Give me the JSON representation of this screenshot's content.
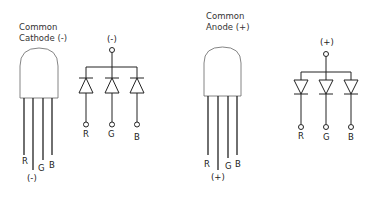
{
  "diagrams": [
    {
      "title_line1": "Common",
      "title_line2": "Cathode (-)",
      "common_label": "(-)",
      "lead_labels": {
        "r": "R",
        "common": "(-)",
        "g": "G",
        "b": "B"
      },
      "schematic": {
        "top_label": "(-)",
        "pins": [
          "R",
          "G",
          "B"
        ],
        "orientation": "cathode-common"
      }
    },
    {
      "title_line1": "Common",
      "title_line2": "Anode (+)",
      "common_label": "(+)",
      "lead_labels": {
        "r": "R",
        "common": "(+)",
        "g": "G",
        "b": "B"
      },
      "schematic": {
        "top_label": "(+)",
        "pins": [
          "R",
          "G",
          "B"
        ],
        "orientation": "anode-common"
      }
    }
  ],
  "colors": {
    "line": "#222222",
    "outline": "#555555",
    "background": "#ffffff"
  }
}
